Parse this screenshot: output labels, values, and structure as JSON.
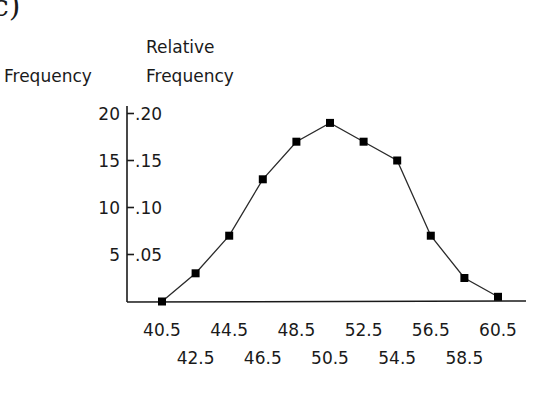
{
  "panel_label": "c)",
  "chart_data": {
    "type": "line",
    "title": "",
    "xlabel": "",
    "ylabel_left": "Frequency",
    "ylabel_right": "Relative Frequency",
    "ylabel_right_lines": [
      "Relative",
      "Frequency"
    ],
    "x": [
      40.5,
      42.5,
      44.5,
      46.5,
      48.5,
      50.5,
      52.5,
      54.5,
      56.5,
      58.5,
      60.5
    ],
    "x_tick_labels_row1": [
      "40.5",
      "44.5",
      "48.5",
      "52.5",
      "56.5",
      "60.5"
    ],
    "x_tick_labels_row2": [
      "42.5",
      "46.5",
      "50.5",
      "54.5",
      "58.5"
    ],
    "values": [
      0,
      3,
      7,
      13,
      17,
      19,
      17,
      15,
      7,
      2.5,
      0.5
    ],
    "relative_values": [
      0.0,
      0.03,
      0.07,
      0.13,
      0.17,
      0.19,
      0.17,
      0.15,
      0.07,
      0.025,
      0.005
    ],
    "y_ticks_frequency": [
      "5",
      "10",
      "15",
      "20"
    ],
    "y_ticks_relative": [
      ".05",
      ".10",
      ".15",
      ".20"
    ],
    "ylim": [
      0,
      20
    ],
    "grid": false,
    "legend": null,
    "marker": "square"
  }
}
